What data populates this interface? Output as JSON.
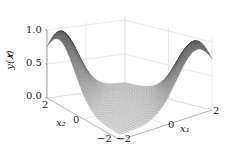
{
  "chart_data": {
    "type": "surface3d",
    "title": "",
    "xlabel": "x_1",
    "ylabel": "x_2",
    "zlabel": "y(x)",
    "xlim": [
      -2,
      2
    ],
    "ylim": [
      -2,
      2
    ],
    "zlim": [
      0.0,
      1.0
    ],
    "x_ticks": [
      "-2",
      "0",
      "2"
    ],
    "y_ticks": [
      "-2",
      "0",
      "2"
    ],
    "z_ticks": [
      "0.0",
      "0.5",
      "1.0"
    ],
    "grid": true,
    "legend": null
  },
  "labels": {
    "z_axis": "y(𝒙)",
    "x1_axis": "x₁",
    "x2_axis": "x₂",
    "z_tick_top": "1.0",
    "z_tick_mid": "0.5",
    "z_tick_bot": "0.0",
    "x2_tick_pos": "2",
    "x2_tick_mid": "0",
    "x2_tick_neg": "−2",
    "x1_tick_neg": "−2",
    "x1_tick_mid": "0",
    "x1_tick_pos": "2"
  }
}
